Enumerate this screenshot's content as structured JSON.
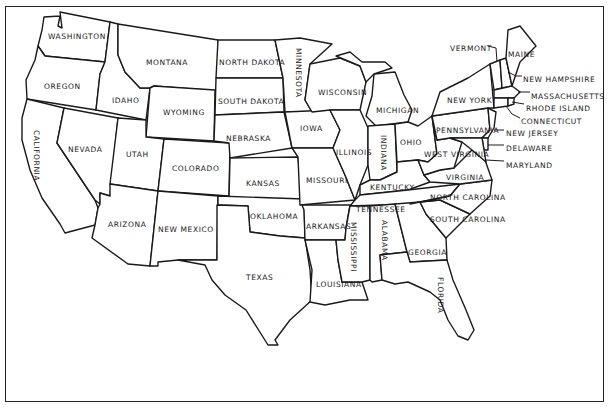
{
  "map": {
    "title": "United States outline map",
    "border_color": "#222222",
    "stroke_color": "#1a1a1a",
    "background_color": "#ffffff",
    "states": [
      {
        "name": "Washington",
        "x": 48,
        "y": 32
      },
      {
        "name": "Oregon",
        "x": 44,
        "y": 82
      },
      {
        "name": "California",
        "x": 32,
        "y": 130
      },
      {
        "name": "Idaho",
        "x": 112,
        "y": 96
      },
      {
        "name": "Nevada",
        "x": 68,
        "y": 145
      },
      {
        "name": "Montana",
        "x": 146,
        "y": 58
      },
      {
        "name": "Wyoming",
        "x": 163,
        "y": 108
      },
      {
        "name": "Utah",
        "x": 126,
        "y": 150
      },
      {
        "name": "Arizona",
        "x": 108,
        "y": 220
      },
      {
        "name": "Colorado",
        "x": 172,
        "y": 164
      },
      {
        "name": "New Mexico",
        "x": 158,
        "y": 225
      },
      {
        "name": "North Dakota",
        "x": 219,
        "y": 58
      },
      {
        "name": "South Dakota",
        "x": 218,
        "y": 97
      },
      {
        "name": "Nebraska",
        "x": 226,
        "y": 134
      },
      {
        "name": "Kansas",
        "x": 246,
        "y": 179
      },
      {
        "name": "Oklahoma",
        "x": 250,
        "y": 212
      },
      {
        "name": "Texas",
        "x": 246,
        "y": 273
      },
      {
        "name": "Minnesota",
        "x": 294,
        "y": 48
      },
      {
        "name": "Iowa",
        "x": 300,
        "y": 124
      },
      {
        "name": "Missouri",
        "x": 306,
        "y": 176
      },
      {
        "name": "Arkansas",
        "x": 306,
        "y": 222
      },
      {
        "name": "Louisiana",
        "x": 316,
        "y": 280
      },
      {
        "name": "Wisconsin",
        "x": 318,
        "y": 88
      },
      {
        "name": "Illinois",
        "x": 336,
        "y": 148
      },
      {
        "name": "Michigan",
        "x": 376,
        "y": 106
      },
      {
        "name": "Indiana",
        "x": 379,
        "y": 135
      },
      {
        "name": "Ohio",
        "x": 400,
        "y": 138
      },
      {
        "name": "Kentucky",
        "x": 370,
        "y": 183
      },
      {
        "name": "Tennessee",
        "x": 356,
        "y": 205
      },
      {
        "name": "Mississippi",
        "x": 349,
        "y": 222
      },
      {
        "name": "Alabama",
        "x": 380,
        "y": 220
      },
      {
        "name": "Georgia",
        "x": 408,
        "y": 248
      },
      {
        "name": "Florida",
        "x": 436,
        "y": 277
      },
      {
        "name": "South Carolina",
        "x": 430,
        "y": 215
      },
      {
        "name": "North Carolina",
        "x": 430,
        "y": 193
      },
      {
        "name": "Virginia",
        "x": 446,
        "y": 173
      },
      {
        "name": "West Virginia",
        "x": 424,
        "y": 150
      },
      {
        "name": "Pennsylvania",
        "x": 436,
        "y": 126
      },
      {
        "name": "New York",
        "x": 447,
        "y": 96
      },
      {
        "name": "Vermont",
        "x": 450,
        "y": 44
      },
      {
        "name": "Maine",
        "x": 508,
        "y": 50
      },
      {
        "name": "New Hampshire",
        "x": 523,
        "y": 75
      },
      {
        "name": "Massachusetts",
        "x": 531,
        "y": 92
      },
      {
        "name": "Rhode Island",
        "x": 526,
        "y": 104
      },
      {
        "name": "Connecticut",
        "x": 521,
        "y": 117
      },
      {
        "name": "New Jersey",
        "x": 506,
        "y": 129
      },
      {
        "name": "Delaware",
        "x": 506,
        "y": 144
      },
      {
        "name": "Maryland",
        "x": 506,
        "y": 161
      }
    ]
  }
}
